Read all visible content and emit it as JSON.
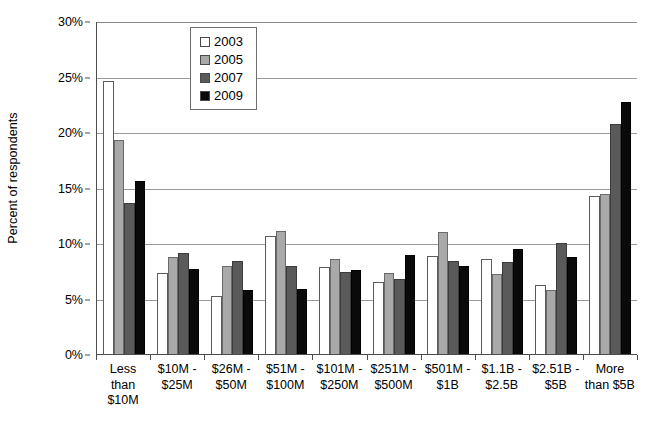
{
  "chart_data": {
    "type": "bar",
    "title": "",
    "xlabel": "",
    "ylabel": "Percent of respondents",
    "ylim": [
      0,
      30
    ],
    "ytick_labels": [
      "0%",
      "5%",
      "10%",
      "15%",
      "20%",
      "25%",
      "30%"
    ],
    "ytick_values": [
      0,
      5,
      10,
      15,
      20,
      25,
      30
    ],
    "grid": true,
    "legend_position": "top-center",
    "categories": [
      "Less than $10M",
      "$10M - $25M",
      "$26M - $50M",
      "$51M - $100M",
      "$101M - $250M",
      "$251M - $500M",
      "$501M - $1B",
      "$1.1B - $2.5B",
      "$2.51B - $5B",
      "More than $5B"
    ],
    "category_lines": [
      [
        "Less",
        "than",
        "$10M"
      ],
      [
        "$10M -",
        "$25M"
      ],
      [
        "$26M -",
        "$50M"
      ],
      [
        "$51M -",
        "$100M"
      ],
      [
        "$101M -",
        "$250M"
      ],
      [
        "$251M -",
        "$500M"
      ],
      [
        "$501M -",
        "$1B"
      ],
      [
        "$1.1B -",
        "$2.5B"
      ],
      [
        "$2.51B -",
        "$5B"
      ],
      [
        "More",
        "than $5B"
      ]
    ],
    "series": [
      {
        "name": "2003",
        "color": "#ffffff",
        "values": [
          24.6,
          7.3,
          5.2,
          10.6,
          7.8,
          6.5,
          8.8,
          8.6,
          6.2,
          14.2
        ]
      },
      {
        "name": "2005",
        "color": "#a9a9a9",
        "values": [
          19.3,
          8.7,
          7.9,
          11.1,
          8.6,
          7.3,
          11.0,
          7.2,
          5.8,
          14.4
        ]
      },
      {
        "name": "2007",
        "color": "#5a5a5a",
        "values": [
          13.6,
          9.1,
          8.4,
          7.9,
          7.4,
          6.8,
          8.4,
          8.3,
          10.0,
          20.7
        ]
      },
      {
        "name": "2009",
        "color": "#0a0a0a",
        "values": [
          15.6,
          7.7,
          5.8,
          5.9,
          7.6,
          8.9,
          7.9,
          9.5,
          8.7,
          22.7
        ]
      }
    ]
  }
}
